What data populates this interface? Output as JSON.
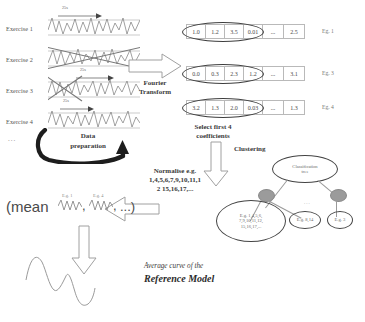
{
  "figure": {
    "bottom_caption": ""
  },
  "exercises": {
    "labels": [
      "Exercise 1",
      "Exercise 2",
      "Exercise 3",
      "Exercise 4"
    ],
    "ellipsis": "...",
    "duration_tag": "25s"
  },
  "data_preparation": {
    "line1": "Data",
    "line2": "preparation"
  },
  "fourier": {
    "line1": "Fourier",
    "line2": "Transform"
  },
  "coefficient_rows": [
    {
      "tag": "Eg. 1",
      "cells": [
        "1.0",
        "1.2",
        "3.5",
        "0.01",
        "...",
        "2.5"
      ],
      "selected_count": 4
    },
    {
      "tag": "Eg. 3",
      "cells": [
        "0.0",
        "0.3",
        "2.3",
        "1.2",
        "...",
        "3.1"
      ],
      "selected_count": 4
    },
    {
      "tag": "Eg. 4",
      "cells": [
        "3.2",
        "1.3",
        "2.0",
        "0.03",
        "...",
        "1.3"
      ],
      "selected_count": 4
    }
  ],
  "select_step": {
    "line1": "Select first 4",
    "line2": "coefficients"
  },
  "clustering": {
    "label": "Clustering"
  },
  "normalise": {
    "line1": "Normalise e.g.",
    "line2": "1,4,5,6,7,9,10,11,1",
    "line3": "2 15,16,17,..."
  },
  "tree": {
    "root_line1": "Classification",
    "root_line2": "tree",
    "leaf_big": {
      "line1": "E.g. 1,4,5,6,",
      "line2": "7,9,10,11,12,",
      "line3": "15,16,17,..."
    },
    "leaf_small_1": "E.g. 8,14",
    "leaf_small_2": "E.g. 3",
    "leaf_dots": "..."
  },
  "mean_expression": {
    "open": "(mean",
    "comma1": ",",
    "comma2": ",",
    "tail": "...)",
    "tag1": "E.g. 1",
    "tag2": "E.g. 4"
  },
  "reference_model": {
    "line1": "Average curve of the",
    "line2": "Reference Model"
  },
  "colors": {
    "ink": "#3a3a3a",
    "line": "#8f8f8f",
    "node_fill": "#9b9b9b",
    "table_border": "#b9b9b9",
    "arrow_stroke": "#9a9a9a"
  }
}
